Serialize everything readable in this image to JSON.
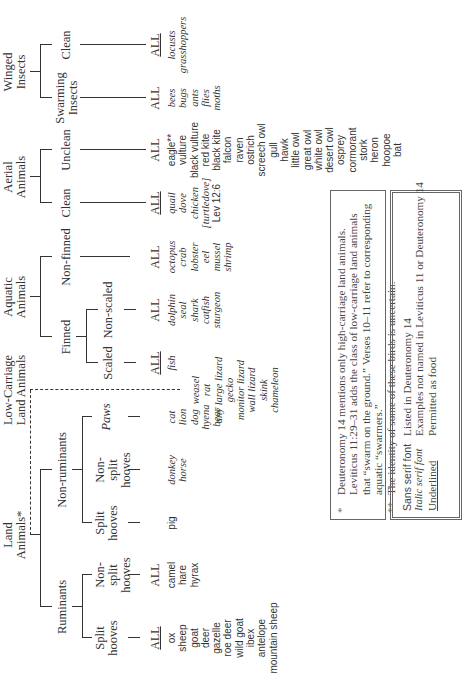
{
  "diagram": {
    "categories": {
      "land": {
        "label": "Land Animals*"
      },
      "low_carriage": {
        "label": "Low-Carriage Land Animals"
      },
      "aquatic": {
        "label": "Aquatic Animals"
      },
      "aerial": {
        "label": "Aerial Animals"
      },
      "winged_insects": {
        "label": "Winged Insects"
      }
    },
    "subcategories": {
      "ruminants": "Ruminants",
      "non_ruminants": "Non-ruminants",
      "rum_split": "Split hooves",
      "rum_nonsplit": "Non-split hooves",
      "nonrum_split": "Split hooves",
      "nonrum_nonsplit": "Non-split hooves",
      "paws": "Paws",
      "finned": "Finned",
      "scaled": "Scaled",
      "non_scaled": "Non-scaled",
      "non_finned": "Non-finned",
      "aerial_clean": "Clean",
      "aerial_unclean": "Unclean",
      "swarming_insects": "Swarming Insects",
      "insects_clean": "Clean"
    },
    "all_label": "ALL",
    "examples": {
      "rum_split": [
        {
          "t": "ox",
          "s": "sans"
        },
        {
          "t": "sheep",
          "s": "sans"
        },
        {
          "t": "goat",
          "s": "sans"
        },
        {
          "t": "deer",
          "s": "sans"
        },
        {
          "t": "gazelle",
          "s": "sans"
        },
        {
          "t": "roe deer",
          "s": "sans"
        },
        {
          "t": "wild goat",
          "s": "sans"
        },
        {
          "t": "ibex",
          "s": "sans"
        },
        {
          "t": "antelope",
          "s": "sans"
        },
        {
          "t": "mountain sheep",
          "s": "sans"
        }
      ],
      "rum_nonsplit": [
        {
          "t": "camel",
          "s": "sans"
        },
        {
          "t": "hare",
          "s": "sans"
        },
        {
          "t": "hyrax",
          "s": "sans"
        }
      ],
      "nonrum_split": [
        {
          "t": "pig",
          "s": "sans"
        }
      ],
      "nonrum_nonsplit": [
        {
          "t": "donkey",
          "s": "italic"
        },
        {
          "t": "horse",
          "s": "italic"
        }
      ],
      "paws": [
        {
          "t": "cat",
          "s": "italic"
        },
        {
          "t": "lion",
          "s": "italic"
        },
        {
          "t": "dog",
          "s": "italic"
        },
        {
          "t": "hyena",
          "s": "italic"
        },
        {
          "t": "bear",
          "s": "italic"
        }
      ],
      "low_carriage": [
        {
          "t": "weasel",
          "s": "italic"
        },
        {
          "t": "rat",
          "s": "italic"
        },
        {
          "t": "any large lizard",
          "s": "italic"
        },
        {
          "t": "gecko",
          "s": "italic"
        },
        {
          "t": "monitor lizard",
          "s": "italic"
        },
        {
          "t": "wall lizard",
          "s": "italic"
        },
        {
          "t": "skink",
          "s": "italic"
        },
        {
          "t": "chameleon",
          "s": "italic"
        }
      ],
      "scaled": [
        {
          "t": "fish",
          "s": "italic"
        }
      ],
      "non_scaled": [
        {
          "t": "dolphin",
          "s": "italic"
        },
        {
          "t": "seal",
          "s": "italic"
        },
        {
          "t": "shark",
          "s": "italic"
        },
        {
          "t": "catfish",
          "s": "italic"
        },
        {
          "t": "sturgeon",
          "s": "italic"
        }
      ],
      "non_finned": [
        {
          "t": "octopus",
          "s": "italic"
        },
        {
          "t": "crab",
          "s": "italic"
        },
        {
          "t": "lobster",
          "s": "italic"
        },
        {
          "t": "eel",
          "s": "italic"
        },
        {
          "t": "mussel",
          "s": "italic"
        },
        {
          "t": "shrimp",
          "s": "italic"
        }
      ],
      "aerial_clean": [
        {
          "t": "quail",
          "s": "italic"
        },
        {
          "t": "dove",
          "s": "italic"
        },
        {
          "t": "chicken",
          "s": "italic"
        },
        {
          "t": "[turtledove]",
          "s": "italic"
        },
        {
          "t": "Lev 12:6",
          "s": "sans"
        }
      ],
      "aerial_unclean": [
        {
          "t": "eagle**",
          "s": "sans"
        },
        {
          "t": "vulture",
          "s": "sans"
        },
        {
          "t": "black vulture",
          "s": "sans"
        },
        {
          "t": "red kite",
          "s": "sans"
        },
        {
          "t": "black kite",
          "s": "sans"
        },
        {
          "t": "falcon",
          "s": "sans"
        },
        {
          "t": "raven",
          "s": "sans"
        },
        {
          "t": "ostrich",
          "s": "sans"
        },
        {
          "t": "screech owl",
          "s": "sans"
        },
        {
          "t": "gull",
          "s": "sans"
        },
        {
          "t": "hawk",
          "s": "sans"
        },
        {
          "t": "little owl",
          "s": "sans"
        },
        {
          "t": "great owl",
          "s": "sans"
        },
        {
          "t": "white owl",
          "s": "sans"
        },
        {
          "t": "desert owl",
          "s": "sans"
        },
        {
          "t": "osprey",
          "s": "sans"
        },
        {
          "t": "cormorant",
          "s": "sans"
        },
        {
          "t": "stork",
          "s": "sans"
        },
        {
          "t": "heron",
          "s": "sans"
        },
        {
          "t": "hoopoe",
          "s": "sans"
        },
        {
          "t": "bat",
          "s": "sans"
        }
      ],
      "swarming_insects": [
        {
          "t": "bees",
          "s": "italic"
        },
        {
          "t": "bugs",
          "s": "italic"
        },
        {
          "t": "ants",
          "s": "italic"
        },
        {
          "t": "flies",
          "s": "italic"
        },
        {
          "t": "moths",
          "s": "italic"
        }
      ],
      "insects_clean": [
        {
          "t": "locusts",
          "s": "italic"
        },
        {
          "t": "grasshoppers",
          "s": "italic"
        }
      ]
    }
  },
  "footnotes": [
    {
      "mark": "*",
      "text": "Deuteronomy 14 mentions only high-carriage land animals. Leviticus 11:29–31 adds the class of low-carriage land animals that “swarm on the ground.” Verses 10–11 refer to corresponding aquatic “swarmers.”"
    },
    {
      "mark": "**",
      "text": "The identity of some of these birds is uncertain."
    }
  ],
  "legend": [
    {
      "key": "Sans serif font",
      "style": "sans",
      "meaning": "Listed in Deuteronomy 14"
    },
    {
      "key": "Italic serif font",
      "style": "italic",
      "meaning": "Examples not named in Leviticus 11 or Deuteronomy 14"
    },
    {
      "key": "Underlined",
      "style": "underline",
      "meaning": "Permitted as food"
    }
  ]
}
